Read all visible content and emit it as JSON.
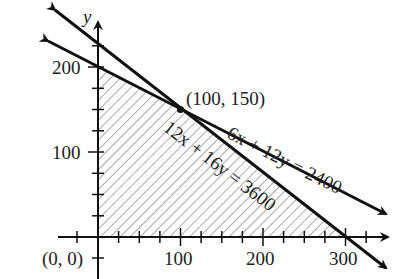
{
  "axes": {
    "x_label": "x",
    "y_label": "y",
    "x_ticks": [
      "100",
      "200",
      "300"
    ],
    "y_ticks": [
      "100",
      "200"
    ],
    "origin_label": "(0, 0)"
  },
  "lines": [
    {
      "equation": "6x + 12y = 2400",
      "intercepts": {
        "x": 400,
        "y": 200
      }
    },
    {
      "equation": "12x + 16y = 3600",
      "intercepts": {
        "x": 300,
        "y": 225
      }
    }
  ],
  "vertex": {
    "label": "(100, 150)",
    "x": 100,
    "y": 150
  },
  "feasible_region": {
    "vertices": [
      [
        0,
        0
      ],
      [
        0,
        200
      ],
      [
        100,
        150
      ],
      [
        300,
        0
      ]
    ],
    "fill": "hatched"
  },
  "colors": {
    "line": "#111111",
    "hatch": "#555555",
    "background": "#ffffff"
  }
}
